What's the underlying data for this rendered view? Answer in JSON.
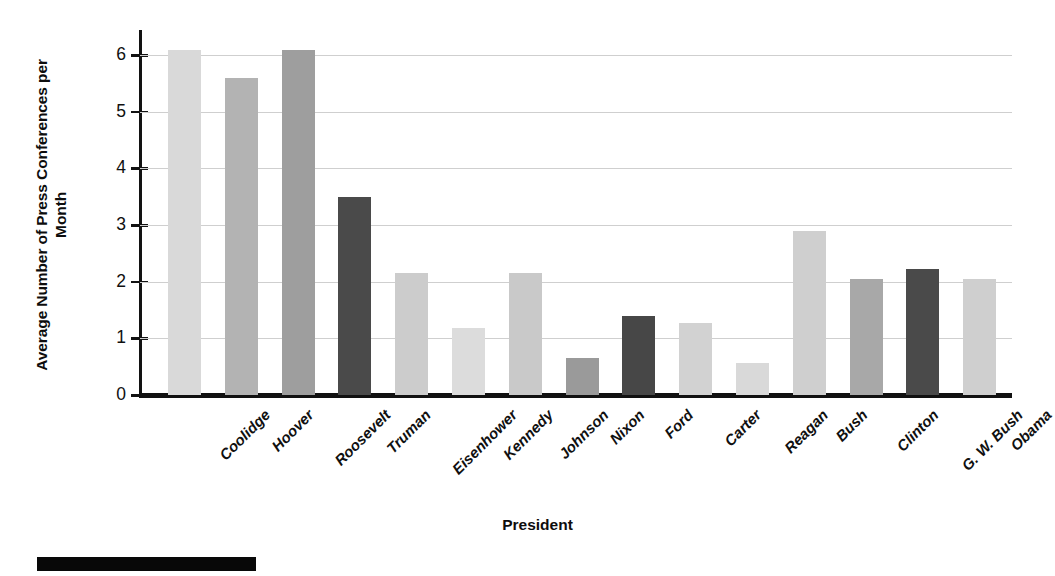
{
  "chart_data": {
    "type": "bar",
    "title": "",
    "xlabel": "President",
    "ylabel": "Average Number of Press Conferences per Month",
    "ylim": [
      0,
      6.25
    ],
    "yticks": [
      0,
      1,
      2,
      3,
      4,
      5,
      6
    ],
    "ytick_labels": [
      "0",
      "1",
      "2",
      "3",
      "4",
      "5",
      "6"
    ],
    "grid": "horizontal",
    "legend": "none",
    "categories": [
      "Coolidge",
      "Hoover",
      "Roosevelt",
      "Truman",
      "Eisenhower",
      "Kennedy",
      "Johnson",
      "Nixon",
      "Ford",
      "Carter",
      "Reagan",
      "Bush",
      "Clinton",
      "G. W. Bush",
      "Obama"
    ],
    "values": [
      6.1,
      5.6,
      6.1,
      3.5,
      2.15,
      1.18,
      2.15,
      0.65,
      1.4,
      1.28,
      0.56,
      2.9,
      2.05,
      2.22,
      2.05
    ],
    "bar_colors": [
      "#d9d9d9",
      "#b3b3b3",
      "#9e9e9e",
      "#4a4a4a",
      "#cccccc",
      "#dcdcdc",
      "#c9c9c9",
      "#9a9a9a",
      "#474747",
      "#d2d2d2",
      "#d9d9d9",
      "#cfcfcf",
      "#a8a8a8",
      "#4a4a4a",
      "#cfcfcf"
    ]
  },
  "axis": {
    "y_title": "Average Number of Press Conferences per Month",
    "x_title": "President"
  },
  "colors": {
    "axis_line": "#111111",
    "gridline": "#cfcfcf",
    "text": "#101010",
    "background": "#ffffff",
    "caption_block": "#080808"
  }
}
